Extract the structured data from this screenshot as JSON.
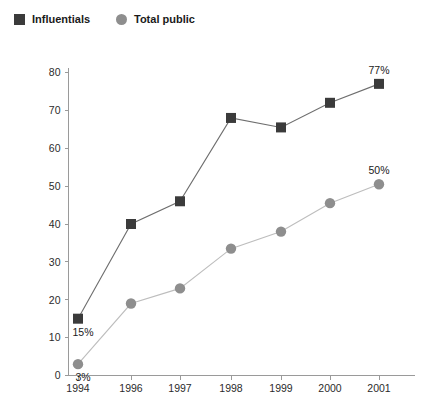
{
  "legend": {
    "items": [
      {
        "label": "Influentials",
        "marker": "square-marker-icon",
        "color": "#3b3b3b"
      },
      {
        "label": "Total public",
        "marker": "circle-marker-icon",
        "color": "#8e8e8e"
      }
    ]
  },
  "chart_data": {
    "type": "line",
    "title": "",
    "subtitle": "",
    "xlabel": "",
    "ylabel": "",
    "categories": [
      "1994",
      "1996",
      "1997",
      "1998",
      "1999",
      "2000",
      "2001"
    ],
    "yticks": [
      "0",
      "10",
      "20",
      "30",
      "40",
      "50",
      "60",
      "70",
      "80"
    ],
    "ylim": [
      0,
      80
    ],
    "grid": false,
    "legend_position": "top-left",
    "series": [
      {
        "name": "Influentials",
        "color": "#3b3b3b",
        "line_color": "#6e6e6e",
        "marker": "square",
        "values": [
          15,
          40,
          46,
          68,
          65.5,
          72,
          77
        ],
        "point_labels": [
          "15%",
          "",
          "",
          "",
          "",
          "",
          "77%"
        ]
      },
      {
        "name": "Total public",
        "color": "#8e8e8e",
        "line_color": "#bdbdbd",
        "marker": "circle",
        "values": [
          3,
          19,
          23,
          33.5,
          38,
          45.5,
          50.5
        ],
        "point_labels": [
          "3%",
          "",
          "",
          "",
          "",
          "",
          "50%"
        ]
      }
    ],
    "annotations": [
      {
        "text": "15%",
        "series": "Influentials",
        "category": "1994"
      },
      {
        "text": "3%",
        "series": "Total public",
        "category": "1994"
      },
      {
        "text": "77%",
        "series": "Influentials",
        "category": "2001"
      },
      {
        "text": "50%",
        "series": "Total public",
        "category": "2001"
      }
    ]
  }
}
